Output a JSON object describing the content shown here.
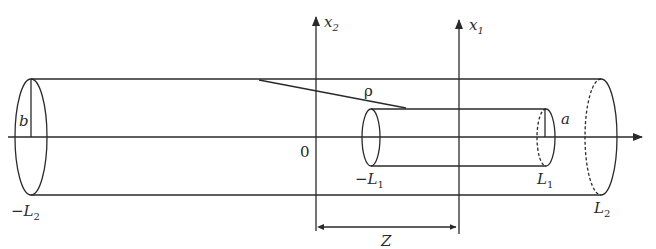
{
  "diagram": {
    "labels": {
      "x2_axis": {
        "main": "x",
        "sub": "2"
      },
      "x1_axis": {
        "main": "x",
        "sub": "1"
      },
      "origin": "0",
      "rho": "ρ",
      "outer_radius": "b",
      "inner_radius": "a",
      "minus_L2": {
        "prefix": "−",
        "main": "L",
        "sub": "2"
      },
      "L2": {
        "main": "L",
        "sub": "2"
      },
      "minus_L1": {
        "prefix": "−",
        "main": "L",
        "sub": "1"
      },
      "L1": {
        "main": "L",
        "sub": "1"
      },
      "Z": "Z"
    },
    "colors": {
      "ink": "#2a2a2a",
      "background": "#ffffff"
    }
  }
}
